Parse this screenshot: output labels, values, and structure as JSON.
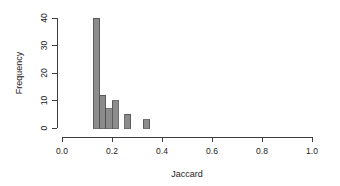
{
  "chart_data": {
    "type": "bar",
    "title": "",
    "subtitle": "",
    "xlabel": "Jaccard",
    "ylabel": "Frequency",
    "xlim": [
      0.0,
      1.0
    ],
    "ylim": [
      0,
      40
    ],
    "xticks": [
      "0.0",
      "0.2",
      "0.4",
      "0.6",
      "0.8",
      "1.0"
    ],
    "xtick_values": [
      0.0,
      0.2,
      0.4,
      0.6,
      0.8,
      1.0
    ],
    "yticks": [
      "0",
      "10",
      "20",
      "30",
      "40"
    ],
    "ytick_values": [
      0,
      10,
      20,
      30,
      40
    ],
    "grid": false,
    "legend": null,
    "bin_width": 0.025,
    "bar_fill": "#8c8c8c",
    "bar_stroke": "#4d4d4d",
    "bins": [
      {
        "x0": 0.125,
        "x1": 0.15,
        "value": 40
      },
      {
        "x0": 0.15,
        "x1": 0.175,
        "value": 12
      },
      {
        "x0": 0.175,
        "x1": 0.2,
        "value": 7
      },
      {
        "x0": 0.2,
        "x1": 0.225,
        "value": 10
      },
      {
        "x0": 0.25,
        "x1": 0.275,
        "value": 5
      },
      {
        "x0": 0.325,
        "x1": 0.35,
        "value": 3
      }
    ],
    "categories": [
      "0.125-0.150",
      "0.150-0.175",
      "0.175-0.200",
      "0.200-0.225",
      "0.250-0.275",
      "0.325-0.350"
    ],
    "values": [
      40,
      12,
      7,
      10,
      5,
      3
    ]
  }
}
